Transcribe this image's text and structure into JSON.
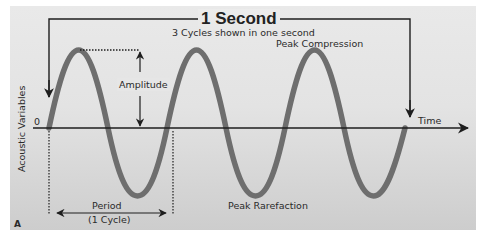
{
  "figure": {
    "panel_letter": "A",
    "title": "1 Second",
    "subtitle": "3 Cycles shown in one second",
    "y_axis_label": "Acoustic Variables",
    "x_axis_label": "Time",
    "origin_label": "0",
    "annotations": {
      "amplitude": "Amplitude",
      "peak_compression": "Peak Compression",
      "peak_rarefaction": "Peak Rarefaction",
      "period_line1": "Period",
      "period_line2": "(1 Cycle)"
    },
    "colors": {
      "wave": "#6e6e6e",
      "axis": "#1e1e1e",
      "background_top": "#e9e9e9",
      "background_bottom": "#cdcdcd"
    },
    "wave": {
      "type": "sine",
      "cycles": 3,
      "duration_seconds": 1
    }
  }
}
